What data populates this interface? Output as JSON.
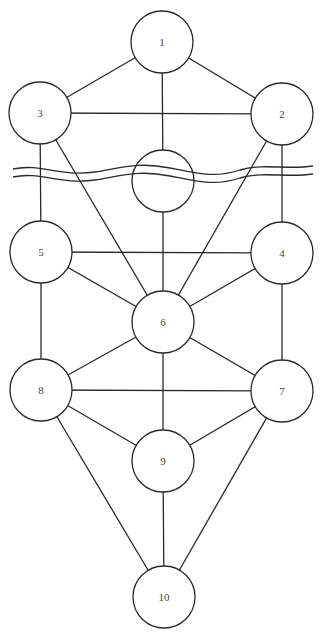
{
  "diagram": {
    "type": "tree-of-life",
    "colors": {
      "stroke": "#2a2a2a",
      "text": "#444444",
      "background": "#ffffff"
    },
    "node_radius": 31,
    "nodes": [
      {
        "id": "1",
        "label": "1",
        "x": 162,
        "y": 42
      },
      {
        "id": "2",
        "label": "2",
        "x": 282,
        "y": 114
      },
      {
        "id": "3",
        "label": "3",
        "x": 40,
        "y": 113
      },
      {
        "id": "daath",
        "label": "",
        "x": 163,
        "y": 181
      },
      {
        "id": "4",
        "label": "4",
        "x": 282,
        "y": 253
      },
      {
        "id": "5",
        "label": "5",
        "x": 41,
        "y": 252
      },
      {
        "id": "6",
        "label": "6",
        "x": 163,
        "y": 322
      },
      {
        "id": "7",
        "label": "7",
        "x": 282,
        "y": 391
      },
      {
        "id": "8",
        "label": "8",
        "x": 41,
        "y": 390
      },
      {
        "id": "9",
        "label": "9",
        "x": 163,
        "y": 461
      },
      {
        "id": "10",
        "label": "10",
        "x": 164,
        "y": 597
      }
    ],
    "edges": [
      [
        "1",
        "2"
      ],
      [
        "1",
        "3"
      ],
      [
        "1",
        "daath"
      ],
      [
        "3",
        "2"
      ],
      [
        "3",
        "5"
      ],
      [
        "2",
        "4"
      ],
      [
        "3",
        "6"
      ],
      [
        "2",
        "6"
      ],
      [
        "daath",
        "6"
      ],
      [
        "5",
        "4"
      ],
      [
        "5",
        "6"
      ],
      [
        "4",
        "6"
      ],
      [
        "5",
        "8"
      ],
      [
        "4",
        "7"
      ],
      [
        "6",
        "8"
      ],
      [
        "6",
        "7"
      ],
      [
        "6",
        "9"
      ],
      [
        "8",
        "7"
      ],
      [
        "8",
        "9"
      ],
      [
        "7",
        "9"
      ],
      [
        "8",
        "10"
      ],
      [
        "7",
        "10"
      ],
      [
        "9",
        "10"
      ]
    ],
    "abyss_waves": [
      "M13,169 C40,163 60,177 95,172 C125,167 140,162 170,168 C200,174 215,178 240,170 C265,163 285,170 313,166",
      "M13,177 C40,171 60,185 95,180 C125,175 140,170 170,176 C200,182 215,186 240,178 C265,171 285,178 313,174"
    ]
  }
}
